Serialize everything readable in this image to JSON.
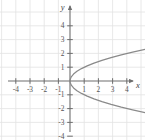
{
  "chart_data": {
    "type": "line",
    "title": "",
    "subtitle": "",
    "xlabel": "x",
    "ylabel": "y",
    "xlim": [
      -4.8,
      5.0
    ],
    "ylim": [
      -4.6,
      4.8
    ],
    "grid": true,
    "grid_spacing": 1,
    "legend": "none",
    "equation": "x = y^2",
    "orientation": "opens-right",
    "vertex": [
      0,
      0
    ],
    "x_ticks": [
      -4,
      -3,
      -2,
      -1,
      1,
      2,
      3,
      4
    ],
    "y_ticks": [
      4,
      3,
      2,
      1,
      -1,
      -2,
      -3,
      -4
    ],
    "x_tick_labels": [
      "-4",
      "-3",
      "-2",
      "-1",
      "1",
      "2",
      "3",
      "4"
    ],
    "y_tick_labels": [
      "4",
      "3",
      "2",
      "1",
      "-1",
      "-2",
      "-3",
      "-4"
    ],
    "series": [
      {
        "name": "parabola",
        "arrow_start": true,
        "arrow_end": true,
        "points": [
          [
            9.61,
            -3.1
          ],
          [
            8.41,
            -2.9
          ],
          [
            7.29,
            -2.7
          ],
          [
            6.25,
            -2.5
          ],
          [
            5.29,
            -2.3
          ],
          [
            4.41,
            -2.1
          ],
          [
            3.61,
            -1.9
          ],
          [
            2.89,
            -1.7
          ],
          [
            2.25,
            -1.5
          ],
          [
            1.69,
            -1.3
          ],
          [
            1.21,
            -1.1
          ],
          [
            0.81,
            -0.9
          ],
          [
            0.49,
            -0.7
          ],
          [
            0.25,
            -0.5
          ],
          [
            0.09,
            -0.3
          ],
          [
            0.01,
            -0.1
          ],
          [
            0,
            0
          ],
          [
            0.01,
            0.1
          ],
          [
            0.09,
            0.3
          ],
          [
            0.25,
            0.5
          ],
          [
            0.49,
            0.7
          ],
          [
            0.81,
            0.9
          ],
          [
            1.21,
            1.1
          ],
          [
            1.69,
            1.3
          ],
          [
            2.25,
            1.5
          ],
          [
            2.89,
            1.7
          ],
          [
            3.61,
            1.9
          ],
          [
            4.41,
            2.1
          ],
          [
            5.29,
            2.3
          ],
          [
            6.25,
            2.5
          ],
          [
            7.29,
            2.7
          ],
          [
            8.41,
            2.9
          ],
          [
            9.61,
            3.1
          ]
        ]
      }
    ]
  },
  "colors": {
    "grid": "#e2e2e2",
    "axis": "#6e6e6e",
    "curve": "#8a8a8a",
    "tick_text": "#555555",
    "axis_label": "#444444",
    "background": "#ffffff"
  },
  "axes": {
    "x_axis_name": "x",
    "y_axis_name": "y",
    "origin_label": ""
  }
}
